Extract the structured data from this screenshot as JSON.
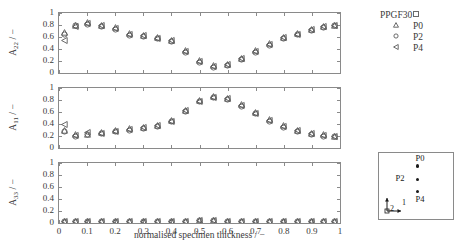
{
  "figure": {
    "xaxis_title": "normalised specimen thickness / −",
    "xticks": [
      "0",
      "0.1",
      "0.2",
      "0.3",
      "0.4",
      "0.5",
      "0.6",
      "0.7",
      "0.8",
      "0.9",
      "1"
    ],
    "yticks": [
      "0",
      "0.2",
      "0.4",
      "0.6",
      "0.8",
      "1"
    ]
  },
  "panels": {
    "a22": {
      "ylabel_main": "A",
      "ylabel_sub": "22",
      "ylabel_unit": " / −"
    },
    "a11": {
      "ylabel_main": "A",
      "ylabel_sub": "11",
      "ylabel_unit": " / −"
    },
    "a33": {
      "ylabel_main": "A",
      "ylabel_sub": "33",
      "ylabel_unit": " / −"
    }
  },
  "legend": {
    "title": "PPGF30",
    "title_marker": "square-icon",
    "entries": [
      {
        "label": "P0",
        "marker": "triangle-up"
      },
      {
        "label": "P2",
        "marker": "circle"
      },
      {
        "label": "P4",
        "marker": "triangle-left"
      }
    ]
  },
  "inset": {
    "points": [
      {
        "label": "P0",
        "x": 0.52,
        "y": 0.8,
        "label_dx": -2,
        "label_dy": -13
      },
      {
        "label": "P2",
        "x": 0.52,
        "y": 0.6,
        "label_dx": -22,
        "label_dy": -6
      },
      {
        "label": "P4",
        "x": 0.52,
        "y": 0.42,
        "label_dx": -2,
        "label_dy": 3
      }
    ],
    "axis_labels": {
      "horizontal": "1",
      "vertical": "2"
    }
  },
  "chart_data": {
    "type": "scatter",
    "title": "",
    "xlabel": "normalised specimen thickness / −",
    "xlim": [
      0,
      1
    ],
    "xticks": [
      0,
      0.1,
      0.2,
      0.3,
      0.4,
      0.5,
      0.6,
      0.7,
      0.8,
      0.9,
      1
    ],
    "ylim": [
      0,
      1
    ],
    "yticks": [
      0,
      0.2,
      0.4,
      0.6,
      0.8,
      1
    ],
    "grid": false,
    "legend_position": "top-right",
    "subplots": [
      {
        "id": "a22",
        "ylabel": "A22 / −",
        "x": [
          0.02,
          0.06,
          0.1,
          0.15,
          0.2,
          0.25,
          0.3,
          0.35,
          0.4,
          0.45,
          0.5,
          0.55,
          0.6,
          0.65,
          0.7,
          0.75,
          0.8,
          0.85,
          0.9,
          0.94,
          0.98
        ],
        "series": [
          {
            "name": "P0",
            "marker": "triangle-up",
            "values": [
              0.67,
              0.8,
              0.84,
              0.8,
              0.76,
              0.66,
              0.63,
              0.6,
              0.55,
              0.38,
              0.21,
              0.12,
              0.15,
              0.25,
              0.37,
              0.49,
              0.6,
              0.66,
              0.73,
              0.78,
              0.8
            ]
          },
          {
            "name": "P2",
            "marker": "circle",
            "values": [
              0.64,
              0.79,
              0.81,
              0.78,
              0.72,
              0.63,
              0.61,
              0.57,
              0.52,
              0.35,
              0.17,
              0.1,
              0.13,
              0.22,
              0.34,
              0.46,
              0.57,
              0.64,
              0.71,
              0.76,
              0.79
            ]
          },
          {
            "name": "P4",
            "marker": "triangle-left",
            "values": [
              0.55,
              0.78,
              0.83,
              0.79,
              0.74,
              0.65,
              0.62,
              0.58,
              0.54,
              0.36,
              0.19,
              0.11,
              0.14,
              0.24,
              0.36,
              0.48,
              0.59,
              0.65,
              0.72,
              0.77,
              0.8
            ]
          }
        ]
      },
      {
        "id": "a11",
        "ylabel": "A11 / −",
        "x": [
          0.02,
          0.06,
          0.1,
          0.15,
          0.2,
          0.25,
          0.3,
          0.35,
          0.4,
          0.45,
          0.5,
          0.55,
          0.6,
          0.65,
          0.7,
          0.75,
          0.8,
          0.85,
          0.9,
          0.94,
          0.98
        ],
        "series": [
          {
            "name": "P0",
            "marker": "triangle-up",
            "values": [
              0.3,
              0.22,
              0.23,
              0.26,
              0.29,
              0.32,
              0.35,
              0.38,
              0.46,
              0.63,
              0.79,
              0.86,
              0.83,
              0.72,
              0.59,
              0.47,
              0.37,
              0.3,
              0.25,
              0.22,
              0.2
            ]
          },
          {
            "name": "P2",
            "marker": "circle",
            "values": [
              0.28,
              0.2,
              0.22,
              0.24,
              0.27,
              0.3,
              0.33,
              0.36,
              0.44,
              0.61,
              0.77,
              0.84,
              0.81,
              0.7,
              0.57,
              0.45,
              0.35,
              0.28,
              0.23,
              0.2,
              0.19
            ]
          },
          {
            "name": "P4",
            "marker": "triangle-left",
            "values": [
              0.4,
              0.21,
              0.26,
              0.25,
              0.28,
              0.31,
              0.34,
              0.37,
              0.45,
              0.62,
              0.78,
              0.85,
              0.82,
              0.71,
              0.58,
              0.46,
              0.36,
              0.29,
              0.24,
              0.21,
              0.2
            ]
          }
        ]
      },
      {
        "id": "a33",
        "ylabel": "A33 / −",
        "x": [
          0.02,
          0.06,
          0.1,
          0.15,
          0.2,
          0.25,
          0.3,
          0.35,
          0.4,
          0.45,
          0.5,
          0.55,
          0.6,
          0.65,
          0.7,
          0.75,
          0.8,
          0.85,
          0.9,
          0.94,
          0.98
        ],
        "series": [
          {
            "name": "P0",
            "marker": "triangle-up",
            "values": [
              0.03,
              0.03,
              0.03,
              0.03,
              0.03,
              0.03,
              0.03,
              0.03,
              0.03,
              0.03,
              0.04,
              0.04,
              0.03,
              0.03,
              0.03,
              0.03,
              0.03,
              0.03,
              0.03,
              0.03,
              0.03
            ]
          },
          {
            "name": "P2",
            "marker": "circle",
            "values": [
              0.03,
              0.03,
              0.03,
              0.03,
              0.03,
              0.03,
              0.03,
              0.03,
              0.03,
              0.03,
              0.04,
              0.04,
              0.03,
              0.03,
              0.03,
              0.03,
              0.03,
              0.03,
              0.03,
              0.03,
              0.03
            ]
          },
          {
            "name": "P4",
            "marker": "triangle-left",
            "values": [
              0.03,
              0.03,
              0.03,
              0.03,
              0.03,
              0.03,
              0.03,
              0.03,
              0.03,
              0.03,
              0.04,
              0.04,
              0.03,
              0.03,
              0.03,
              0.03,
              0.03,
              0.03,
              0.03,
              0.03,
              0.03
            ]
          }
        ]
      }
    ]
  }
}
